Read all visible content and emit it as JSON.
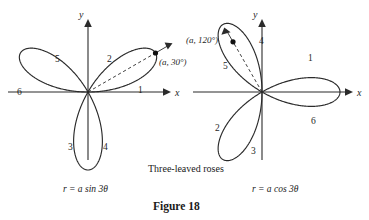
{
  "figure": {
    "caption_middle": "Three-leaved roses",
    "caption_bottom": "Figure 18"
  },
  "left_plot": {
    "equation": "r = a sin 3θ",
    "x_axis_label": "x",
    "y_axis_label": "y",
    "point_label": "(a, 30°)",
    "petal_numbers": [
      "1",
      "2",
      "3",
      "4",
      "5",
      "6"
    ],
    "curve_color": "#2b2b2b",
    "axis_color": "#2b2b2b"
  },
  "right_plot": {
    "equation": "r = a cos 3θ",
    "x_axis_label": "x",
    "y_axis_label": "y",
    "point_label": "(a, 120°)",
    "petal_numbers": [
      "1",
      "2",
      "3",
      "4",
      "5",
      "6"
    ],
    "curve_color": "#2b2b2b",
    "axis_color": "#2b2b2b"
  },
  "chart_data": {
    "type": "line",
    "title": "Three-leaved roses",
    "subtitle": "Figure 18",
    "plots": [
      {
        "name": "left",
        "equation": "r = a sin 3θ",
        "polar_form": "r = a*sin(3*theta)",
        "amplitude_a": 1.0,
        "origin_px": [
          88,
          92
        ],
        "scale_px_per_a": 78,
        "petal_axis_angles_deg": [
          30,
          150,
          270
        ],
        "marked_point": {
          "label": "(a, 30°)",
          "r": "a",
          "theta_deg": 30
        },
        "ray_angle_deg": 30,
        "petal_region_labels": [
          {
            "text": "1",
            "theta_range_deg": [
              0,
              60
            ],
            "position_px": [
              141,
              92
            ]
          },
          {
            "text": "2",
            "theta_range_deg": [
              0,
              60
            ],
            "position_px": [
              110,
              62
            ]
          },
          {
            "text": "3",
            "theta_range_deg": [
              240,
              300
            ],
            "position_px": [
              71,
              148
            ]
          },
          {
            "text": "4",
            "theta_range_deg": [
              240,
              300
            ],
            "position_px": [
              105,
              148
            ]
          },
          {
            "text": "5",
            "theta_range_deg": [
              120,
              180
            ],
            "position_px": [
              58,
              62
            ]
          },
          {
            "text": "6",
            "theta_range_deg": [
              120,
              180
            ],
            "position_px": [
              21,
              95
            ]
          }
        ],
        "x_label": "x",
        "y_label": "y",
        "x_axis_range_px": [
          8,
          168
        ],
        "y_axis_range_px": [
          20,
          160
        ]
      },
      {
        "name": "right",
        "equation": "r = a cos 3θ",
        "polar_form": "r = a*cos(3*theta)",
        "amplitude_a": 1.0,
        "origin_px": [
          262,
          92
        ],
        "scale_px_per_a": 78,
        "petal_axis_angles_deg": [
          0,
          120,
          240
        ],
        "marked_point": {
          "label": "(a, 120°)",
          "r": "a",
          "theta_deg": 120
        },
        "ray_angle_deg": 120,
        "petal_region_labels": [
          {
            "text": "1",
            "theta_range_deg": [
              -30,
              30
            ],
            "position_px": [
              311,
              60
            ]
          },
          {
            "text": "2",
            "theta_range_deg": [
              210,
              270
            ],
            "position_px": [
              218,
              129
            ]
          },
          {
            "text": "3",
            "theta_range_deg": [
              210,
              270
            ],
            "position_px": [
              253,
              152
            ]
          },
          {
            "text": "4",
            "theta_range_deg": [
              90,
              150
            ],
            "position_px": [
              262,
              43
            ]
          },
          {
            "text": "5",
            "theta_range_deg": [
              90,
              150
            ],
            "position_px": [
              226,
              68
            ]
          },
          {
            "text": "6",
            "theta_range_deg": [
              -30,
              30
            ],
            "position_px": [
              314,
              122
            ]
          }
        ],
        "x_label": "x",
        "y_label": "y",
        "x_axis_range_px": [
          193,
          350
        ],
        "y_axis_range_px": [
          20,
          160
        ]
      }
    ],
    "grid": false,
    "legend": "none"
  }
}
